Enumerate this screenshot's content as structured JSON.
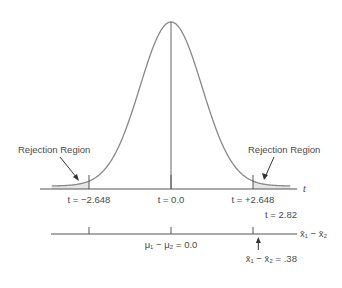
{
  "chart_data": {
    "type": "line",
    "title": "",
    "distribution": "t",
    "xlim": [
      -3.8,
      3.8
    ],
    "peak_t": 0.0,
    "critical_values": [
      -2.648,
      2.648
    ],
    "rejection_label": "Rejection Region",
    "t_axis_label": "t",
    "t_ticks": [
      {
        "value": -2.648,
        "label": "t = −2.648"
      },
      {
        "value": 0.0,
        "label": "t = 0.0"
      },
      {
        "value": 2.648,
        "label": "t = +2.648"
      }
    ],
    "observed": {
      "t": 2.82,
      "t_label": "t = 2.82",
      "diff_label": "x̄₁ − x̄₂ = .38"
    },
    "diff_axis_label": "x̄₁ − x̄₂",
    "diff_center_label": "μ₁ − μ₂ = 0.0"
  }
}
